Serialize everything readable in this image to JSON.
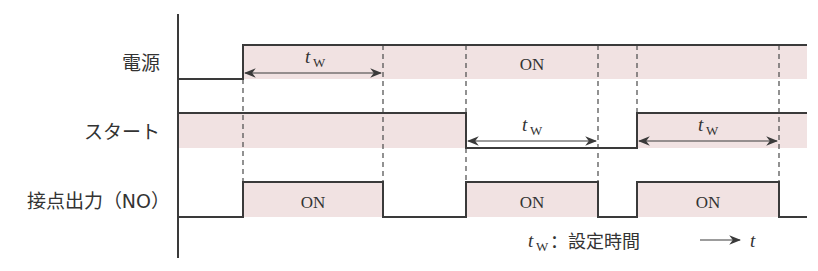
{
  "diagram": {
    "type": "timing-diagram",
    "colors": {
      "line": "#3a3a3a",
      "fill_on": "#f1e2e2",
      "dash": "#4a4a4a",
      "text": "#333333"
    },
    "rows": [
      {
        "label": "電源",
        "id": "power"
      },
      {
        "label": "スタート",
        "id": "start"
      },
      {
        "label": "接点出力（NO）",
        "id": "contact-output"
      }
    ],
    "on_labels": [
      "ON",
      "ON",
      "ON",
      "ON"
    ],
    "tw": {
      "t": "t",
      "sub": "W"
    },
    "legend": {
      "tw_t": "t",
      "tw_sub": "W",
      "desc": "：設定時間",
      "time_arrow": "⟶",
      "time_label": "t"
    }
  }
}
